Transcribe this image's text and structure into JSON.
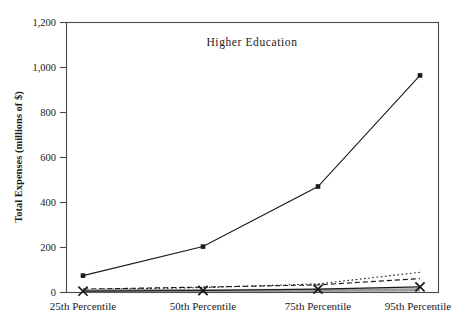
{
  "chart_data": {
    "type": "line",
    "title": "Higher Education",
    "xlabel": "",
    "ylabel": "Total Expenses (millions of $)",
    "categories": [
      "25th Percentile",
      "50th Percentile",
      "75th Percentile",
      "95th Percentile"
    ],
    "ylim": [
      0,
      1200
    ],
    "yticks": [
      0,
      200,
      400,
      600,
      800,
      1000,
      1200
    ],
    "ytick_labels": [
      "0",
      "200",
      "400",
      "600",
      "800",
      "1,000",
      "1,200"
    ],
    "grid": false,
    "legend": "none",
    "series": [
      {
        "name": "total-expenses-solid-square",
        "style": "solid",
        "marker": "square",
        "color": "#1a1a1a",
        "values": [
          75,
          204,
          471,
          965
        ]
      },
      {
        "name": "dotted-series",
        "style": "dotted",
        "marker": "none",
        "color": "#1a1a1a",
        "values": [
          14,
          22,
          38,
          90
        ]
      },
      {
        "name": "dashed-series",
        "style": "dashed",
        "marker": "none",
        "color": "#1a1a1a",
        "values": [
          15,
          24,
          34,
          62
        ]
      },
      {
        "name": "thick-gray-series",
        "style": "solid-thick",
        "marker": "none",
        "color": "#9a9a9a",
        "values": [
          8,
          9,
          10,
          12
        ]
      },
      {
        "name": "x-marker-series",
        "style": "solid",
        "marker": "cross",
        "color": "#1a1a1a",
        "values": [
          6,
          9,
          15,
          25
        ]
      }
    ]
  },
  "axes": {
    "y_axis_title": "Total Expenses (millions of $)",
    "y_tick_labels": [
      "1,200",
      "1,000",
      "800",
      "600",
      "400",
      "200",
      "0"
    ],
    "x_tick_labels": [
      "25th Percentile",
      "50th Percentile",
      "75th Percentile",
      "95th Percentile"
    ]
  },
  "title": {
    "text": "Higher Education"
  },
  "colors": {
    "axis": "#4a4a4a",
    "ink": "#1a1a1a",
    "gray_series": "#9a9a9a",
    "background": "#ffffff"
  }
}
